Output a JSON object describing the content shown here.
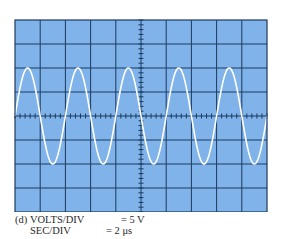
{
  "caption": {
    "label": "(d)",
    "volts_div_label": "VOLTS/DIV",
    "volts_div_value": "= 5 V",
    "sec_div_label": "SEC/DIV",
    "sec_div_value": "= 2 μs"
  },
  "colors": {
    "screen_bg": "#7fb3ea",
    "grid_line": "#1d3a5e",
    "trace": "#ffffff"
  },
  "chart_data": {
    "type": "line",
    "subtitle": "(d) VOLTS/DIV = 5 V, SEC/DIV = 2 μs",
    "xlabel": "time (2 μs/div)",
    "ylabel": "voltage (5 V/div)",
    "grid": true,
    "divisions": {
      "horizontal": 10,
      "vertical": 8
    },
    "minor_ticks_per_division": 5,
    "volts_per_div": 5,
    "sec_per_div_us": 2,
    "waveform": {
      "shape": "sine",
      "amplitude_div": 2,
      "amplitude_V": 10,
      "peak_to_peak_V": 20,
      "period_div": 2,
      "period_us": 4,
      "frequency_kHz": 250,
      "cycles_shown": 5,
      "phase_at_left_edge": "zero crossing, rising"
    },
    "xlim_div": [
      0,
      10
    ],
    "ylim_div": [
      -4,
      4
    ]
  }
}
